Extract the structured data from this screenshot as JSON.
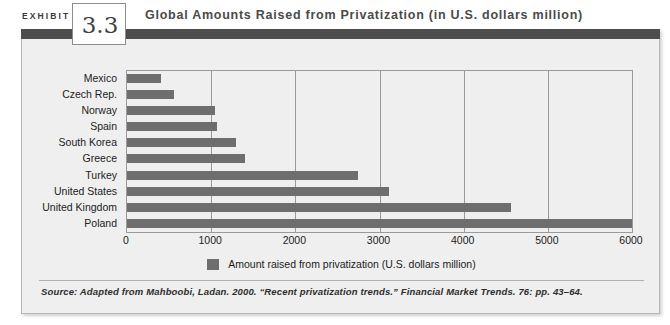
{
  "header": {
    "exhibit_word": "EXHIBIT",
    "exhibit_number": "3.3",
    "title": "Global Amounts Raised from Privatization (in U.S. dollars million)"
  },
  "legend": {
    "label": "Amount raised from privatization (U.S. dollars million)",
    "swatch_color": "#6e6e6e"
  },
  "source": {
    "text": "Source: Adapted from Mahboobi, Ladan. 2000. “Recent privatization trends.” Financial Market Trends. 76: pp. 43–64."
  },
  "colors": {
    "bar": "#6e6e6e",
    "band": "#4d4d4d",
    "panel": "#efefef",
    "grid": "#9a9a9a"
  },
  "chart_data": {
    "type": "bar",
    "orientation": "horizontal",
    "title": "Global Amounts Raised from Privatization (in U.S. dollars million)",
    "xlabel": "Amount raised from privatization (U.S. dollars million)",
    "ylabel": "",
    "categories": [
      "Mexico",
      "Czech Rep.",
      "Norway",
      "Spain",
      "South Korea",
      "Greece",
      "Turkey",
      "United States",
      "United Kingdom",
      "Poland"
    ],
    "values": [
      400,
      560,
      1050,
      1070,
      1300,
      1400,
      2740,
      3110,
      4560,
      6000
    ],
    "series": [
      {
        "name": "Amount raised from privatization (U.S. dollars million)",
        "values": [
          400,
          560,
          1050,
          1070,
          1300,
          1400,
          2740,
          3110,
          4560,
          6000
        ]
      }
    ],
    "xlim": [
      0,
      6000
    ],
    "xticks": [
      0,
      1000,
      2000,
      3000,
      4000,
      5000,
      6000
    ],
    "xtick_labels": [
      "0",
      "1000",
      "2000",
      "3000",
      "4000",
      "5000",
      "6000"
    ],
    "grid": true,
    "legend_position": "bottom"
  }
}
